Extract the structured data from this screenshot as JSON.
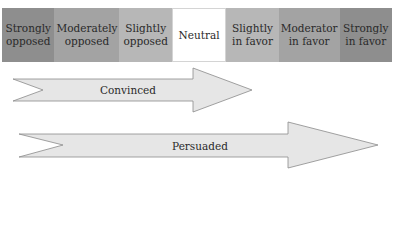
{
  "scale": {
    "cells": [
      {
        "label": "Strongly opposed",
        "line1": "Strongly",
        "line2": "opposed",
        "color": "#8e8e8e"
      },
      {
        "label": "Moderately opposed",
        "line1": "Moderately",
        "line2": "opposed",
        "color": "#a3a3a3"
      },
      {
        "label": "Slightly opposed",
        "line1": "Slightly",
        "line2": "opposed",
        "color": "#b7b7b7"
      },
      {
        "label": "Neutral",
        "line1": "Neutral",
        "line2": "",
        "color": "#ffffff"
      },
      {
        "label": "Slightly in favor",
        "line1": "Slightly",
        "line2": "in favor",
        "color": "#b7b7b7"
      },
      {
        "label": "Moderator in favor",
        "line1": "Moderator",
        "line2": "in favor",
        "color": "#a3a3a3"
      },
      {
        "label": "Strongly in favor",
        "line1": "Strongly",
        "line2": "in favor",
        "color": "#8e8e8e"
      }
    ]
  },
  "arrows": [
    {
      "label": "Convinced",
      "fill": "#e6e6e6",
      "stroke": "#8a8a8a"
    },
    {
      "label": "Persuaded",
      "fill": "#e6e6e6",
      "stroke": "#8a8a8a"
    }
  ]
}
